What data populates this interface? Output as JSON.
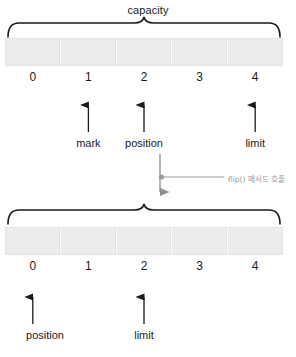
{
  "diagram": {
    "title_top": "capacity",
    "top_buffer": {
      "capacity_label": "capacity",
      "indices": [
        "0",
        "1",
        "2",
        "3",
        "4"
      ],
      "pointers": [
        {
          "label": "mark",
          "index": 1
        },
        {
          "label": "position",
          "index": 2
        },
        {
          "label": "limit",
          "index": 4
        }
      ]
    },
    "transition": {
      "annotation": "flip() 메서드 호출"
    },
    "bottom_buffer": {
      "indices": [
        "0",
        "1",
        "2",
        "3",
        "4"
      ],
      "pointers": [
        {
          "label": "position",
          "index": 0
        },
        {
          "label": "limit",
          "index": 2
        }
      ]
    },
    "colors": {
      "cell_fill": "#ececec",
      "cell_border": "#e3e3e3",
      "stroke": "#1a1a1a",
      "muted": "#9a9a9a",
      "background": "#ffffff"
    }
  }
}
